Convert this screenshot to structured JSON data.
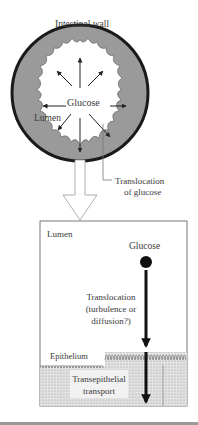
{
  "figure": {
    "top_panel": {
      "title": "Intestinal wall",
      "center_label": "Glucose",
      "lumen_label": "Lumen",
      "callout_line1": "Translocation",
      "callout_line2": "of glucose"
    },
    "bottom_panel": {
      "lumen_label": "Lumen",
      "glucose_label": "Glucose",
      "translocation_line1": "Translocation",
      "translocation_line2": "(turbulence or",
      "translocation_line3": "diffusion?)",
      "epithelium_label": "Epithelium",
      "transport_line1": "Transepithelial",
      "transport_line2": "transport"
    },
    "colors": {
      "wall_fill": "#9a9a9a",
      "ring_stroke": "#1a1a1a",
      "epithelium_fill": "#d4d4d4",
      "text": "#3a3a3a",
      "bottom_rule": "#9a9a9a"
    }
  }
}
